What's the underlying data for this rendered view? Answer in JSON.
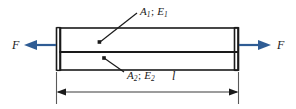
{
  "figure": {
    "background_color": "#ffffff",
    "line_color": "#1a1a1a",
    "arrow_color": "#2f5c94",
    "dimension_color": "#4a4a4a"
  },
  "labels": {
    "upper_layer": {
      "name": "A",
      "name_sub": "1",
      "separator": ";",
      "modulus": "E",
      "modulus_sub": "1",
      "full_text": "A1; E1"
    },
    "lower_layer": {
      "name": "A",
      "name_sub": "2",
      "separator": ";",
      "modulus": "E",
      "modulus_sub": "2",
      "full_text": "A2; E2"
    },
    "force_left": "F",
    "force_right": "F",
    "length": "l"
  },
  "geometry": {
    "bar_left_x": 56,
    "bar_right_x": 238,
    "bar_top_y": 28,
    "bar_divider_y": 52,
    "bar_bottom_y": 70,
    "dimension_line_y": 92,
    "force_axis_y": 45
  },
  "icons": {
    "force_arrow_left": "arrow-left",
    "force_arrow_right": "arrow-right",
    "dimension_arrow_left": "dimension-arrow-left",
    "dimension_arrow_right": "dimension-arrow-right",
    "leader_dot_upper": "leader-dot",
    "leader_dot_lower": "leader-dot"
  }
}
